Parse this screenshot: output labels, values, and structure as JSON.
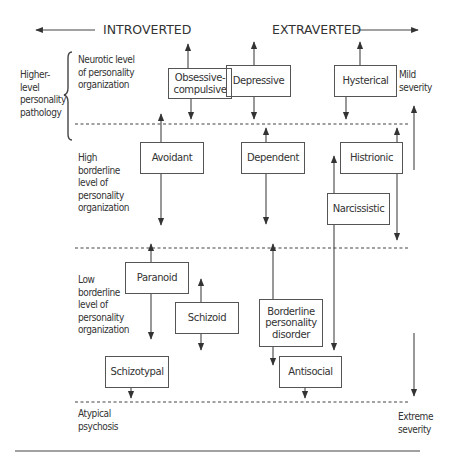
{
  "header": {
    "left_label": "INTROVERTED",
    "right_label": "EXTRAVERTED"
  },
  "left_labels": {
    "higher_level": "Higher-level personality pathology",
    "neurotic": "Neurotic level of personality organization",
    "high_borderline": "High borderline level of personality organization",
    "low_borderline": "Low borderline level of personality organization",
    "atypical_psychosis": "Atypical psychosis"
  },
  "right_labels": {
    "mild": "Mild severity",
    "extreme": "Extreme severity"
  },
  "boxes": {
    "obsessive_compulsive": "Obsessive-compulsive",
    "depressive": "Depressive",
    "hysterical": "Hysterical",
    "avoidant": "Avoidant",
    "dependent": "Dependent",
    "histrionic": "Histrionic",
    "narcissistic": "Narcissistic",
    "paranoid": "Paranoid",
    "schizoid": "Schizoid",
    "borderline": "Borderline personality disorder",
    "antisocial": "Antisocial",
    "schizotypal": "Schizotypal"
  },
  "colors": {
    "line": "#444444",
    "text": "#333333",
    "background": "#ffffff"
  }
}
